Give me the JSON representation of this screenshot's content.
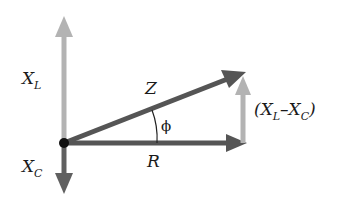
{
  "diagram": {
    "colors": {
      "light_arrow": "#b3b3b3",
      "dark_arrow": "#555555",
      "origin_dot": "#111111",
      "text": "#1a1a1a"
    },
    "labels": {
      "xl_main": "X",
      "xl_sub": "L",
      "xc_main": "X",
      "xc_sub": "C",
      "z": "Z",
      "r": "R",
      "phi": "ϕ",
      "diff_open": "(X",
      "diff_sub1": "L",
      "diff_mid": "–X",
      "diff_sub2": "C",
      "diff_close": ")"
    },
    "vectors": [
      {
        "name": "X_L",
        "from": [
          64,
          143
        ],
        "to": [
          64,
          18
        ],
        "color": "light"
      },
      {
        "name": "X_C",
        "from": [
          64,
          143
        ],
        "to": [
          64,
          193
        ],
        "color": "dark"
      },
      {
        "name": "R",
        "from": [
          64,
          143
        ],
        "to": [
          245,
          143
        ],
        "color": "dark"
      },
      {
        "name": "Z",
        "from": [
          64,
          143
        ],
        "to": [
          245,
          72
        ],
        "color": "dark"
      },
      {
        "name": "X_L-X_C",
        "from": [
          243,
          143
        ],
        "to": [
          243,
          77
        ],
        "color": "light"
      }
    ]
  }
}
